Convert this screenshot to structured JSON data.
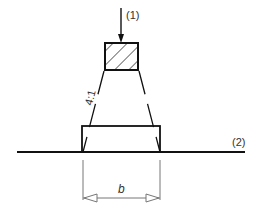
{
  "diagram": {
    "load_label": "(1)",
    "ground_label": "(2)",
    "ratio_label": "4:1",
    "dimension_label": "b",
    "colors": {
      "stroke": "#111111",
      "dimension": "#777777",
      "text": "#333333",
      "background": "#ffffff"
    }
  }
}
